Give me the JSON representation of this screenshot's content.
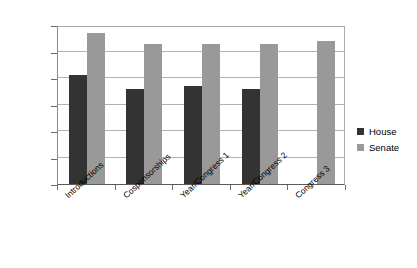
{
  "chart_data": {
    "type": "bar",
    "title": "",
    "xlabel": "",
    "ylabel": "% of Acts Devoted to Promise Keeping",
    "ylim": [
      0,
      60
    ],
    "yticks": [
      0,
      10,
      20,
      30,
      40,
      50,
      60
    ],
    "grid": true,
    "legend_position": "right",
    "categories": [
      "Introductions",
      "Cosponsorships",
      "Year/Congress 1",
      "Year/Congress 2",
      "Congress 3"
    ],
    "series": [
      {
        "name": "House",
        "color": "#333333",
        "values": [
          41,
          36,
          37,
          36,
          null
        ]
      },
      {
        "name": "Senate",
        "color": "#999999",
        "values": [
          57,
          53,
          53,
          53,
          54
        ]
      }
    ]
  },
  "legend": {
    "entries": [
      {
        "label": "House"
      },
      {
        "label": "Senate"
      }
    ]
  }
}
